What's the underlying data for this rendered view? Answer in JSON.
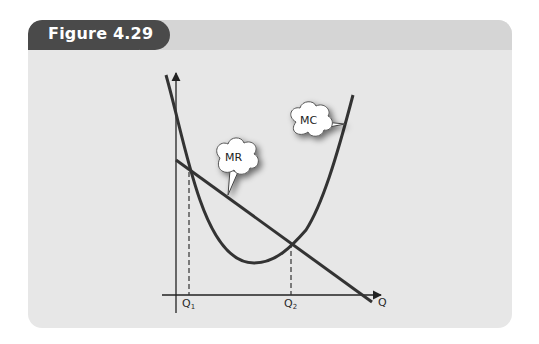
{
  "figure": {
    "title": "Figure 4.29",
    "colors": {
      "panel_bg": "#e7e7e7",
      "header_band": "#d5d5d5",
      "tab_bg": "#4a4a4a",
      "curve": "#333333"
    }
  },
  "diagram": {
    "type": "economics-cost-revenue",
    "axes": {
      "x_label": "Q",
      "y_label": ""
    },
    "curves": [
      {
        "name": "MC",
        "shape": "U-shaped"
      },
      {
        "name": "MR",
        "shape": "downward-sloping line"
      }
    ],
    "callouts": {
      "mc": "MC",
      "mr": "MR"
    },
    "quantity_marks": [
      {
        "label": "Q",
        "subscript": "1"
      },
      {
        "label": "Q",
        "subscript": "2"
      }
    ]
  }
}
